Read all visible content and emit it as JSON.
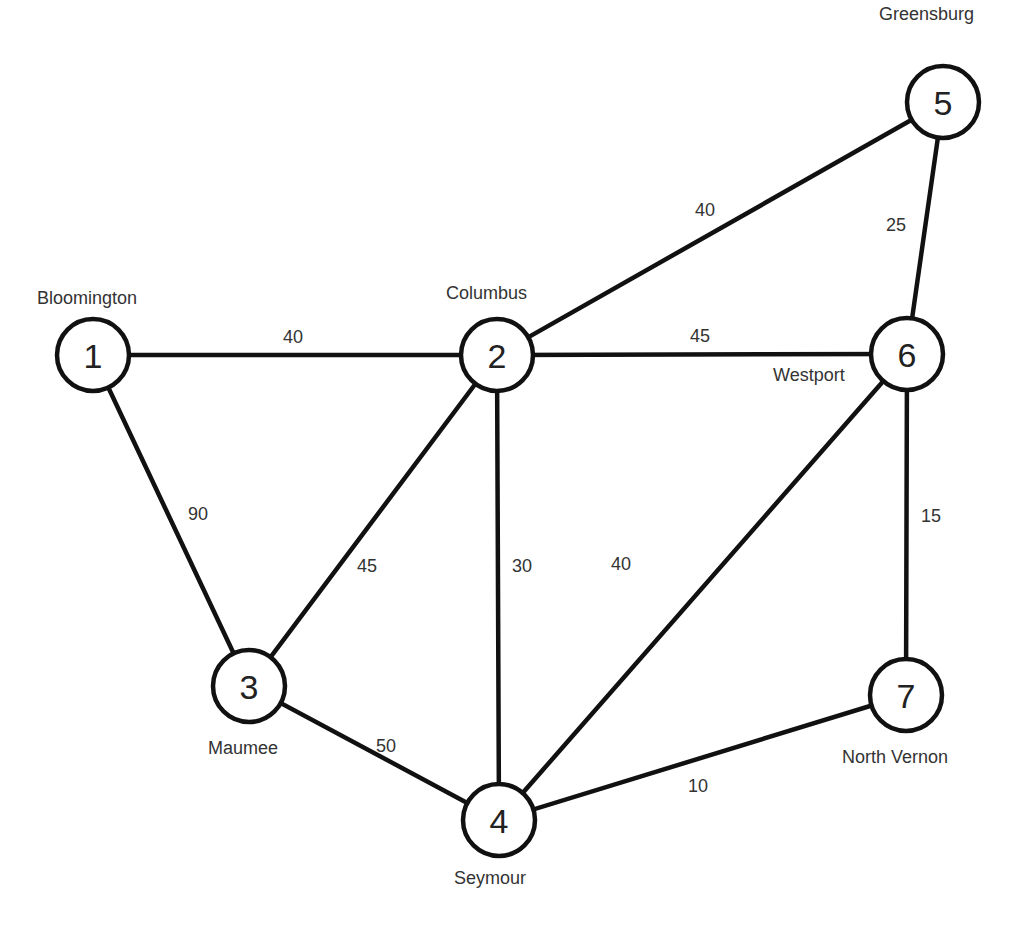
{
  "diagram": {
    "type": "weighted-undirected-network",
    "nodes": [
      {
        "id": "1",
        "label": "1",
        "city": "Bloomington",
        "x": 93,
        "y": 355
      },
      {
        "id": "2",
        "label": "2",
        "city": "Columbus",
        "x": 497,
        "y": 355
      },
      {
        "id": "3",
        "label": "3",
        "city": "Maumee",
        "x": 249,
        "y": 686
      },
      {
        "id": "4",
        "label": "4",
        "city": "Seymour",
        "x": 499,
        "y": 820
      },
      {
        "id": "5",
        "label": "5",
        "city": "Greensburg",
        "x": 943,
        "y": 102
      },
      {
        "id": "6",
        "label": "6",
        "city": "Westport",
        "x": 907,
        "y": 354
      },
      {
        "id": "7",
        "label": "7",
        "city": "North Vernon",
        "x": 906,
        "y": 695
      }
    ],
    "edges": [
      {
        "from": "1",
        "to": "2",
        "weight": "40"
      },
      {
        "from": "1",
        "to": "3",
        "weight": "90"
      },
      {
        "from": "2",
        "to": "3",
        "weight": "45"
      },
      {
        "from": "2",
        "to": "4",
        "weight": "30"
      },
      {
        "from": "2",
        "to": "5",
        "weight": "40"
      },
      {
        "from": "2",
        "to": "6",
        "weight": "45"
      },
      {
        "from": "3",
        "to": "4",
        "weight": "50"
      },
      {
        "from": "4",
        "to": "6",
        "weight": "40"
      },
      {
        "from": "4",
        "to": "7",
        "weight": "10"
      },
      {
        "from": "5",
        "to": "6",
        "weight": "25"
      },
      {
        "from": "6",
        "to": "7",
        "weight": "15"
      }
    ]
  }
}
